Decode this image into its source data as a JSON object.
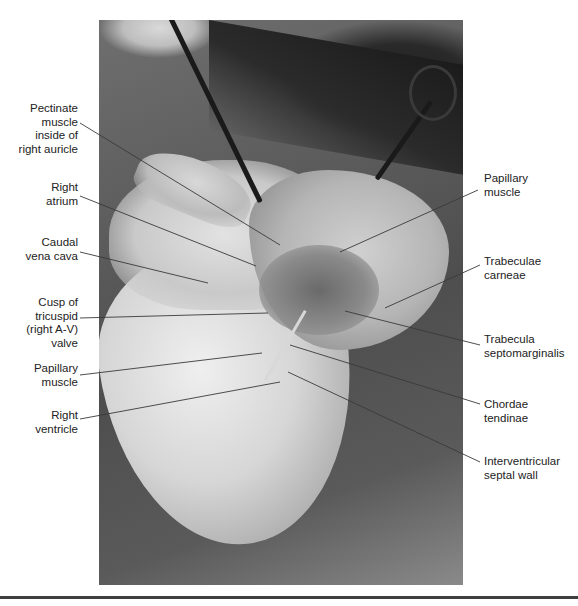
{
  "figure": {
    "labels_left": [
      {
        "id": "pectinate",
        "lines": [
          "Pectinate",
          "muscle",
          "inside of",
          "right auricle"
        ]
      },
      {
        "id": "right-atrium",
        "lines": [
          "Right",
          "atrium"
        ]
      },
      {
        "id": "caudal-vena-cava",
        "lines": [
          "Caudal",
          "vena cava"
        ]
      },
      {
        "id": "tricuspid-cusp",
        "lines": [
          "Cusp of",
          "tricuspid",
          "(right A-V)",
          "valve"
        ]
      },
      {
        "id": "papillary-left",
        "lines": [
          "Papillary",
          "muscle"
        ]
      },
      {
        "id": "right-ventricle",
        "lines": [
          "Right",
          "ventricle"
        ]
      }
    ],
    "labels_right": [
      {
        "id": "papillary-right",
        "lines": [
          "Papillary",
          "muscle"
        ]
      },
      {
        "id": "trabeculae-carneae",
        "lines": [
          "Trabeculae",
          "carneae"
        ]
      },
      {
        "id": "trabecula-septomarginalis",
        "lines": [
          "Trabecula",
          "septomarginalis"
        ]
      },
      {
        "id": "chordae-tendinae",
        "lines": [
          "Chordae",
          "tendinae"
        ]
      },
      {
        "id": "interventricular-septal-wall",
        "lines": [
          "Interventricular",
          "septal wall"
        ]
      }
    ]
  }
}
